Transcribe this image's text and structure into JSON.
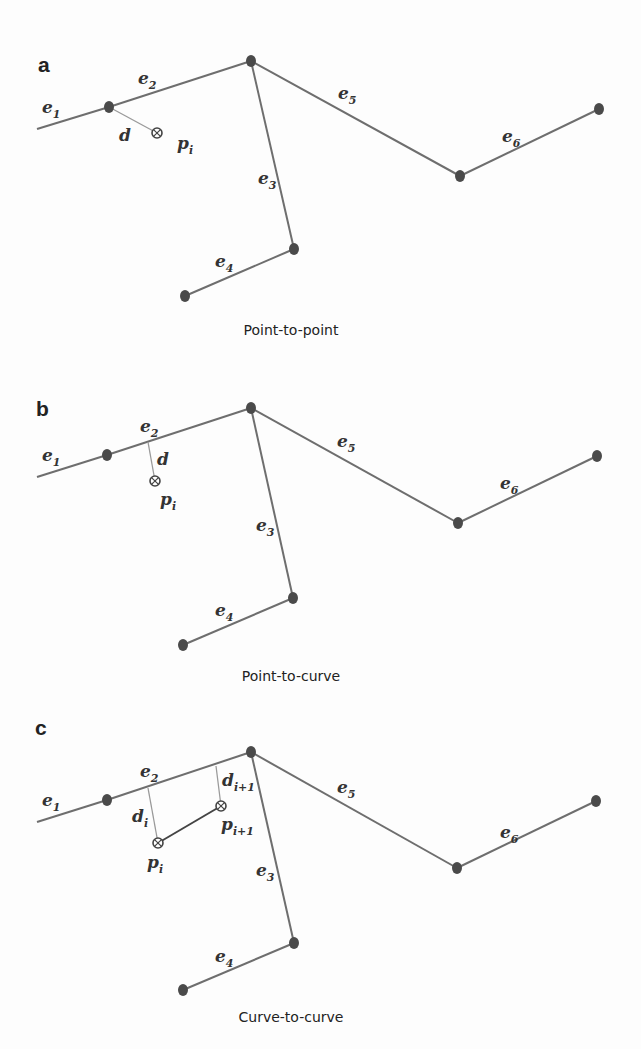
{
  "figure": {
    "panels": [
      {
        "id": "a",
        "label": "a",
        "caption": "Point-to-point",
        "label_pos": [
          38,
          72
        ],
        "caption_pos": [
          291,
          335
        ],
        "nodes": {
          "start": [
            37,
            129
          ],
          "A": [
            109,
            107
          ],
          "B": [
            251,
            61
          ],
          "C": [
            460,
            176
          ],
          "D": [
            599,
            109
          ],
          "E": [
            294,
            249
          ],
          "F": [
            185,
            296
          ]
        },
        "edges": [
          {
            "name": "e",
            "sub": "1",
            "from": "start",
            "to": "A",
            "label_pos": [
              42,
              113
            ]
          },
          {
            "name": "e",
            "sub": "2",
            "from": "A",
            "to": "B",
            "label_pos": [
              138,
              84
            ]
          },
          {
            "name": "e",
            "sub": "3",
            "from": "B",
            "to": "E",
            "label_pos": [
              258,
              184
            ]
          },
          {
            "name": "e",
            "sub": "4",
            "from": "F",
            "to": "E",
            "label_pos": [
              215,
              267
            ]
          },
          {
            "name": "e",
            "sub": "5",
            "from": "B",
            "to": "C",
            "label_pos": [
              338,
              99
            ]
          },
          {
            "name": "e",
            "sub": "6",
            "from": "C",
            "to": "D",
            "label_pos": [
              502,
              142
            ]
          }
        ],
        "distances": [
          {
            "label": "d",
            "sub": "",
            "from": [
              109,
              107
            ],
            "to": [
              157,
              133
            ],
            "label_pos": [
              119,
              141
            ]
          }
        ],
        "points": [
          {
            "name": "p",
            "sub": "i",
            "pos": [
              157,
              133
            ],
            "label_pos": [
              177,
              149
            ]
          }
        ],
        "trajectory": []
      },
      {
        "id": "b",
        "label": "b",
        "caption": "Point-to-curve",
        "label_pos": [
          36,
          416
        ],
        "caption_pos": [
          291,
          681
        ],
        "nodes": {
          "start": [
            37,
            477
          ],
          "A": [
            107,
            455
          ],
          "B": [
            251,
            408
          ],
          "C": [
            458,
            523
          ],
          "D": [
            597,
            456
          ],
          "E": [
            293,
            598
          ],
          "F": [
            183,
            645
          ]
        },
        "edges": [
          {
            "name": "e",
            "sub": "1",
            "from": "start",
            "to": "A",
            "label_pos": [
              42,
              461
            ]
          },
          {
            "name": "e",
            "sub": "2",
            "from": "A",
            "to": "B",
            "label_pos": [
              140,
              432
            ]
          },
          {
            "name": "e",
            "sub": "3",
            "from": "B",
            "to": "E",
            "label_pos": [
              256,
              531
            ]
          },
          {
            "name": "e",
            "sub": "4",
            "from": "F",
            "to": "E",
            "label_pos": [
              215,
              616
            ]
          },
          {
            "name": "e",
            "sub": "5",
            "from": "B",
            "to": "C",
            "label_pos": [
              337,
              447
            ]
          },
          {
            "name": "e",
            "sub": "6",
            "from": "C",
            "to": "D",
            "label_pos": [
              500,
              489
            ]
          }
        ],
        "distances": [
          {
            "label": "d",
            "sub": "",
            "from": [
              148,
              442
            ],
            "to": [
              155,
              481
            ],
            "label_pos": [
              157,
              465
            ]
          }
        ],
        "points": [
          {
            "name": "p",
            "sub": "i",
            "pos": [
              155,
              481
            ],
            "label_pos": [
              160,
              505
            ]
          }
        ],
        "trajectory": []
      },
      {
        "id": "c",
        "label": "c",
        "caption": "Curve-to-curve",
        "label_pos": [
          35,
          735
        ],
        "caption_pos": [
          291,
          1022
        ],
        "nodes": {
          "start": [
            37,
            822
          ],
          "A": [
            107,
            800
          ],
          "B": [
            251,
            752
          ],
          "C": [
            457,
            868
          ],
          "D": [
            596,
            801
          ],
          "E": [
            294,
            943
          ],
          "F": [
            183,
            990
          ]
        },
        "edges": [
          {
            "name": "e",
            "sub": "1",
            "from": "start",
            "to": "A",
            "label_pos": [
              42,
              806
            ]
          },
          {
            "name": "e",
            "sub": "2",
            "from": "A",
            "to": "B",
            "label_pos": [
              140,
              777
            ]
          },
          {
            "name": "e",
            "sub": "3",
            "from": "B",
            "to": "E",
            "label_pos": [
              256,
              876
            ]
          },
          {
            "name": "e",
            "sub": "4",
            "from": "F",
            "to": "E",
            "label_pos": [
              215,
              962
            ]
          },
          {
            "name": "e",
            "sub": "5",
            "from": "B",
            "to": "C",
            "label_pos": [
              337,
              793
            ]
          },
          {
            "name": "e",
            "sub": "6",
            "from": "C",
            "to": "D",
            "label_pos": [
              500,
              838
            ]
          }
        ],
        "distances": [
          {
            "label": "d",
            "sub": "i",
            "from": [
              148,
              788
            ],
            "to": [
              158,
              843
            ],
            "label_pos": [
              132,
              822
            ]
          },
          {
            "label": "d",
            "sub": "i+1",
            "from": [
              216,
              766
            ],
            "to": [
              221,
              806
            ],
            "label_pos": [
              222,
              786
            ]
          }
        ],
        "points": [
          {
            "name": "p",
            "sub": "i",
            "pos": [
              158,
              843
            ],
            "label_pos": [
              147,
              868
            ]
          },
          {
            "name": "p",
            "sub": "i+1",
            "pos": [
              221,
              806
            ],
            "label_pos": [
              221,
              830
            ]
          }
        ],
        "trajectory": [
          [
            158,
            843
          ],
          [
            221,
            806
          ]
        ]
      }
    ]
  }
}
